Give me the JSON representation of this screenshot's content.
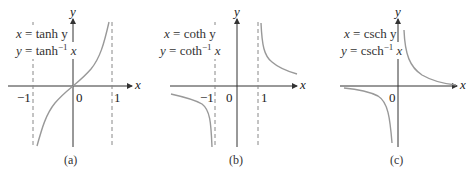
{
  "figure": {
    "panels": [
      {
        "id": "a",
        "caption": "(a)",
        "eq1_lhs": "x",
        "eq1_rhs": "tanh y",
        "eq2_lhs": "y",
        "eq2_rhs_fn": "tanh",
        "eq2_sup": "−1",
        "eq2_arg": "x",
        "x_axis_label": "x",
        "y_axis_label": "y",
        "tick_neg1": "−1",
        "tick_0": "0",
        "tick_1": "1",
        "asymptotes": [
          -1,
          1
        ],
        "curve": "y = tanh⁻¹ x"
      },
      {
        "id": "b",
        "caption": "(b)",
        "eq1_lhs": "x",
        "eq1_rhs": "coth y",
        "eq2_lhs": "y",
        "eq2_rhs_fn": "coth",
        "eq2_sup": "−1",
        "eq2_arg": "x",
        "x_axis_label": "x",
        "y_axis_label": "y",
        "tick_neg1": "−1",
        "tick_0": "0",
        "tick_1": "1",
        "asymptotes": [
          -1,
          1
        ],
        "curve": "y = coth⁻¹ x"
      },
      {
        "id": "c",
        "caption": "(c)",
        "eq1_lhs": "x",
        "eq1_rhs": "csch y",
        "eq2_lhs": "y",
        "eq2_rhs_fn": "csch",
        "eq2_sup": "−1",
        "eq2_arg": "x",
        "x_axis_label": "x",
        "y_axis_label": "y",
        "tick_0": "0",
        "asymptotes": [],
        "curve": "y = csch⁻¹ x"
      }
    ],
    "colors": {
      "axis": "#333333",
      "curve": "#999999",
      "asymptote": "#888888",
      "text": "#222222"
    }
  }
}
